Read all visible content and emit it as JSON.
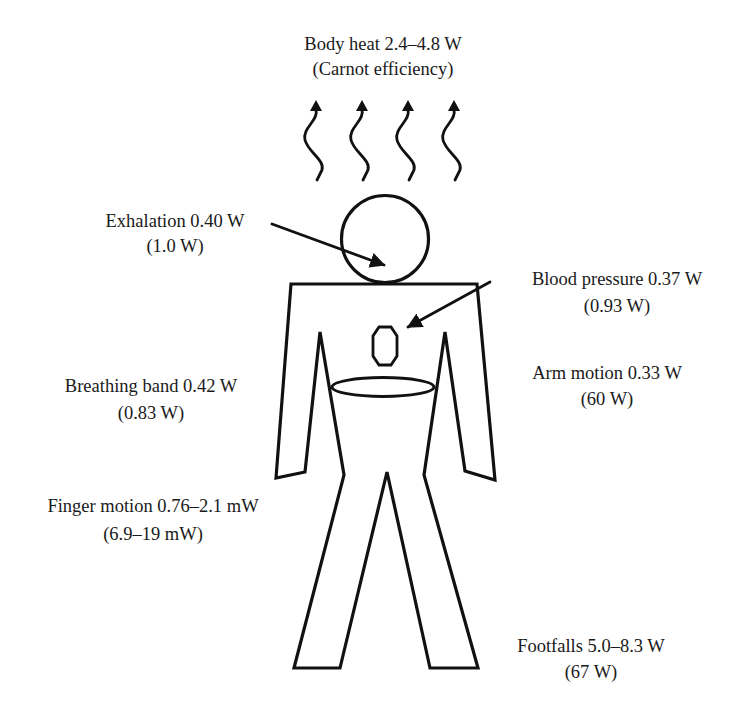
{
  "figure": {
    "colors": {
      "ink": "#111111",
      "background": "#ffffff"
    }
  },
  "labels": {
    "body_heat": {
      "line1": "Body heat 2.4–4.8 W",
      "line2": "(Carnot efficiency)"
    },
    "exhalation": {
      "line1": "Exhalation 0.40 W",
      "line2": "(1.0 W)"
    },
    "blood_pressure": {
      "line1": "Blood pressure 0.37 W",
      "line2": "(0.93 W)"
    },
    "breathing_band": {
      "line1": "Breathing band 0.42 W",
      "line2": "(0.83 W)"
    },
    "arm_motion": {
      "line1": "Arm motion 0.33 W",
      "line2": "(60 W)"
    },
    "finger_motion": {
      "line1": "Finger motion 0.76–2.1 mW",
      "line2": "(6.9–19 mW)"
    },
    "footfalls": {
      "line1": "Footfalls 5.0–8.3 W",
      "line2": "(67 W)"
    }
  },
  "sources": [
    {
      "name": "Body heat",
      "power": "2.4–4.8 W",
      "note": "Carnot efficiency"
    },
    {
      "name": "Exhalation",
      "power": "0.40 W",
      "total": "1.0 W"
    },
    {
      "name": "Blood pressure",
      "power": "0.37 W",
      "total": "0.93 W"
    },
    {
      "name": "Breathing band",
      "power": "0.42 W",
      "total": "0.83 W"
    },
    {
      "name": "Arm motion",
      "power": "0.33 W",
      "total": "60 W"
    },
    {
      "name": "Finger motion",
      "power": "0.76–2.1 mW",
      "total": "6.9–19 mW"
    },
    {
      "name": "Footfalls",
      "power": "5.0–8.3 W",
      "total": "67 W"
    }
  ],
  "icons": {
    "heat_waves": "wavy-up-arrow-icon",
    "pointer": "arrow-icon"
  }
}
